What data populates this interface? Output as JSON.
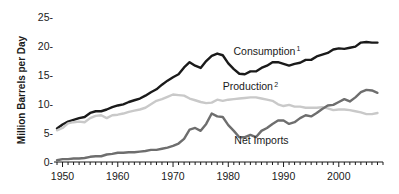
{
  "chart_data": {
    "type": "line",
    "title": "",
    "subtitle": "",
    "xlabel": "",
    "ylabel": "Million Barrels per Day",
    "xlim": [
      1949,
      2008
    ],
    "ylim": [
      0,
      26
    ],
    "grid": false,
    "legend_position": "inline-annotations",
    "x_ticks_major": [
      1950,
      1960,
      1970,
      1980,
      1990,
      2000
    ],
    "x_tick_labels": [
      "1950",
      "1960",
      "1970",
      "1980",
      "1990",
      "2000"
    ],
    "x_ticks_minor_interval": 1,
    "y_ticks": [
      0,
      5,
      10,
      15,
      20,
      25
    ],
    "y_tick_labels": [
      "0-",
      "5-",
      "10-",
      "15-",
      "20-",
      "25-"
    ],
    "x": [
      1949,
      1950,
      1951,
      1952,
      1953,
      1954,
      1955,
      1956,
      1957,
      1958,
      1959,
      1960,
      1961,
      1962,
      1963,
      1964,
      1965,
      1966,
      1967,
      1968,
      1969,
      1970,
      1971,
      1972,
      1973,
      1974,
      1975,
      1976,
      1977,
      1978,
      1979,
      1980,
      1981,
      1982,
      1983,
      1984,
      1985,
      1986,
      1987,
      1988,
      1989,
      1990,
      1991,
      1992,
      1993,
      1994,
      1995,
      1996,
      1997,
      1998,
      1999,
      2000,
      2001,
      2002,
      2003,
      2004,
      2005,
      2006,
      2007
    ],
    "series": [
      {
        "name": "Consumption",
        "label": "Consumption",
        "superscript": "1",
        "color": "#1a1a1a",
        "line_width": 2.4,
        "label_x": 1987,
        "label_y": 18.6,
        "values": [
          5.8,
          6.5,
          7.0,
          7.3,
          7.6,
          7.8,
          8.5,
          8.8,
          8.8,
          9.1,
          9.5,
          9.8,
          10.0,
          10.4,
          10.7,
          11.0,
          11.5,
          12.1,
          12.6,
          13.4,
          14.1,
          14.7,
          15.2,
          16.4,
          17.3,
          16.7,
          16.3,
          17.5,
          18.4,
          18.8,
          18.5,
          17.1,
          16.1,
          15.3,
          15.2,
          15.7,
          15.7,
          16.3,
          16.7,
          17.3,
          17.3,
          17.0,
          16.7,
          17.0,
          17.2,
          17.7,
          17.7,
          18.3,
          18.6,
          18.9,
          19.5,
          19.7,
          19.6,
          19.8,
          20.0,
          20.7,
          20.8,
          20.7,
          20.7
        ]
      },
      {
        "name": "Production",
        "label": "Production",
        "superscript": "2",
        "color": "#c9c9c9",
        "line_width": 2.4,
        "label_x": 1984,
        "label_y": 12.5,
        "values": [
          5.5,
          5.9,
          6.7,
          6.9,
          7.0,
          6.9,
          7.6,
          8.0,
          8.1,
          7.6,
          8.1,
          8.2,
          8.4,
          8.7,
          8.9,
          9.1,
          9.4,
          10.0,
          10.6,
          10.9,
          11.3,
          11.7,
          11.6,
          11.5,
          11.0,
          10.7,
          10.4,
          10.2,
          10.3,
          10.8,
          10.6,
          10.8,
          10.9,
          11.0,
          11.1,
          11.2,
          11.2,
          11.0,
          10.8,
          10.6,
          10.0,
          9.7,
          9.9,
          9.6,
          9.6,
          9.4,
          9.4,
          9.4,
          9.5,
          9.3,
          9.0,
          9.1,
          9.1,
          9.0,
          8.8,
          8.6,
          8.3,
          8.3,
          8.5
        ]
      },
      {
        "name": "Net Imports",
        "label": "Net Imports",
        "superscript": "",
        "color": "#6e6e6e",
        "line_width": 2.4,
        "label_x": 1986,
        "label_y": 3.2,
        "values": [
          0.3,
          0.5,
          0.5,
          0.6,
          0.6,
          0.7,
          0.9,
          1.0,
          1.0,
          1.3,
          1.4,
          1.6,
          1.6,
          1.7,
          1.7,
          1.8,
          1.9,
          2.1,
          2.1,
          2.3,
          2.5,
          2.8,
          3.2,
          4.0,
          5.6,
          5.9,
          5.4,
          6.6,
          8.4,
          7.9,
          7.8,
          6.4,
          5.4,
          4.3,
          4.3,
          4.7,
          4.3,
          5.4,
          5.9,
          6.6,
          7.2,
          7.2,
          6.6,
          6.9,
          7.6,
          8.1,
          7.9,
          8.5,
          9.2,
          9.8,
          9.9,
          10.4,
          10.9,
          10.5,
          11.2,
          12.1,
          12.5,
          12.4,
          12.0
        ]
      }
    ],
    "annotations": [
      {
        "text": "Consumption",
        "superscript": "1"
      },
      {
        "text": "Production",
        "superscript": "2"
      },
      {
        "text": "Net Imports",
        "superscript": ""
      }
    ]
  }
}
